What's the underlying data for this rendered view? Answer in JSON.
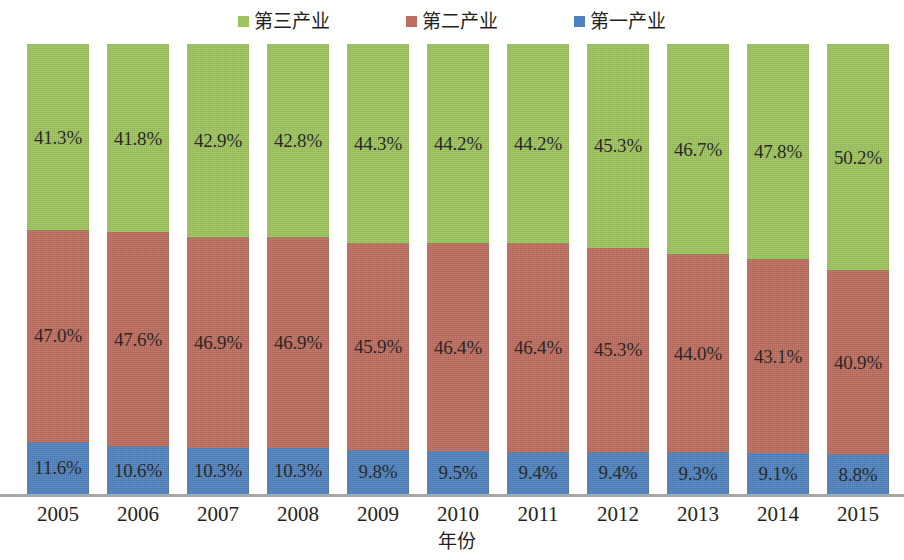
{
  "chart_data": {
    "type": "bar",
    "subtype": "stacked-percentage",
    "title": "",
    "xlabel": "年份",
    "ylabel": "",
    "ylim": [
      0,
      100
    ],
    "grid": false,
    "legend_position": "top-center",
    "categories": [
      "2005",
      "2006",
      "2007",
      "2008",
      "2009",
      "2010",
      "2011",
      "2012",
      "2013",
      "2014",
      "2015"
    ],
    "series": [
      {
        "name": "第三产业",
        "color": "#9dc45e",
        "values": [
          41.3,
          41.8,
          42.9,
          42.8,
          44.3,
          44.2,
          44.2,
          45.3,
          46.7,
          47.8,
          50.2
        ],
        "labels": [
          "41.3%",
          "41.8%",
          "42.9%",
          "42.8%",
          "44.3%",
          "44.2%",
          "44.2%",
          "45.3%",
          "46.7%",
          "47.8%",
          "50.2%"
        ]
      },
      {
        "name": "第二产业",
        "color": "#bc6d5f",
        "values": [
          47.0,
          47.6,
          46.9,
          46.9,
          45.9,
          46.4,
          46.4,
          45.3,
          44.0,
          43.1,
          40.9
        ],
        "labels": [
          "47.0%",
          "47.6%",
          "46.9%",
          "46.9%",
          "45.9%",
          "46.4%",
          "46.4%",
          "45.3%",
          "44.0%",
          "43.1%",
          "40.9%"
        ]
      },
      {
        "name": "第一产业",
        "color": "#4f82bd",
        "values": [
          11.6,
          10.6,
          10.3,
          10.3,
          9.8,
          9.5,
          9.4,
          9.4,
          9.3,
          9.1,
          8.8
        ],
        "labels": [
          "11.6%",
          "10.6%",
          "10.3%",
          "10.3%",
          "9.8%",
          "9.5%",
          "9.4%",
          "9.4%",
          "9.3%",
          "9.1%",
          "8.8%"
        ]
      }
    ]
  },
  "legend": {
    "items": [
      {
        "label": "第三产业",
        "color": "#9dc45e"
      },
      {
        "label": "第二产业",
        "color": "#bc6d5f"
      },
      {
        "label": "第一产业",
        "color": "#4f82bd"
      }
    ]
  },
  "axis": {
    "x_title": "年份",
    "tick_labels": [
      "2005",
      "2006",
      "2007",
      "2008",
      "2009",
      "2010",
      "2011",
      "2012",
      "2013",
      "2014",
      "2015"
    ],
    "line_color": "#a6a6a6"
  }
}
